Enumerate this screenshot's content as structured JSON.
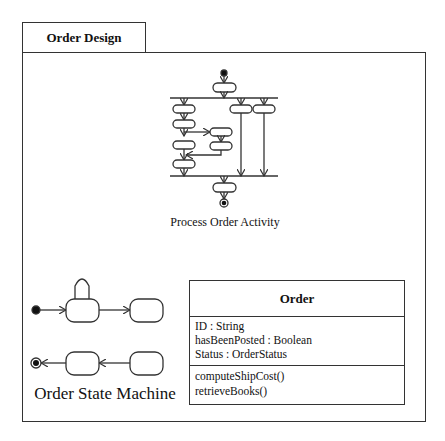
{
  "frame": {
    "title": "Order Design"
  },
  "activity": {
    "caption": "Process Order Activity"
  },
  "state_machine": {
    "caption": "Order State Machine"
  },
  "class": {
    "name": "Order",
    "attributes": [
      "ID : String",
      "hasBeenPosted : Boolean",
      "Status : OrderStatus"
    ],
    "operations": [
      "computeShipCost()",
      "retrieveBooks()"
    ]
  },
  "colors": {
    "line": "#333333",
    "background": "#ffffff"
  }
}
